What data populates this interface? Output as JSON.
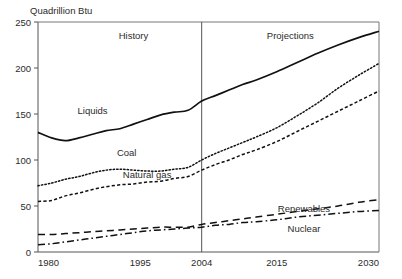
{
  "chart_data": {
    "type": "line",
    "title": "Quadrillion Btu",
    "xlabel": "",
    "ylabel": "Quadrillion Btu",
    "xlim": [
      1980,
      2030
    ],
    "ylim": [
      0,
      250
    ],
    "yticks": [
      0,
      50,
      100,
      150,
      200,
      250
    ],
    "xticks": [
      1980,
      1995,
      2004,
      2015,
      2030
    ],
    "grid": false,
    "legend": "inline-annotations",
    "annotations": [
      {
        "text": "History",
        "x": 1994,
        "y": 232
      },
      {
        "text": "Projections",
        "x": 2017,
        "y": 232
      }
    ],
    "divider_x": 2004,
    "x": [
      1980,
      1982,
      1984,
      1986,
      1988,
      1990,
      1992,
      1994,
      1996,
      1998,
      2000,
      2002,
      2004,
      2006,
      2008,
      2010,
      2012,
      2015,
      2018,
      2021,
      2024,
      2027,
      2030
    ],
    "series": [
      {
        "name": "Liquids",
        "style": "solid",
        "label_x": 1988,
        "label_y": 150,
        "values": [
          130,
          124,
          121,
          124,
          128,
          132,
          134,
          139,
          144,
          149,
          152,
          154,
          164,
          170,
          176,
          182,
          187,
          196,
          206,
          216,
          225,
          233,
          240
        ]
      },
      {
        "name": "Coal",
        "style": "dotted",
        "label_x": 1993,
        "label_y": 104,
        "values": [
          72,
          75,
          79,
          82,
          86,
          89,
          90,
          89,
          88,
          88,
          90,
          92,
          100,
          107,
          113,
          119,
          125,
          135,
          148,
          162,
          178,
          192,
          205
        ]
      },
      {
        "name": "Natural gas",
        "style": "dashed-fine",
        "label_x": 1996,
        "label_y": 80,
        "values": [
          55,
          56,
          61,
          64,
          68,
          71,
          73,
          74,
          76,
          77,
          80,
          82,
          89,
          95,
          100,
          106,
          111,
          120,
          131,
          142,
          153,
          164,
          175
        ]
      },
      {
        "name": "Renewables",
        "style": "dashed",
        "label_x": 2019,
        "label_y": 44,
        "values": [
          19,
          19,
          20,
          21,
          22,
          23,
          24,
          25,
          26,
          27,
          27,
          27,
          30,
          32,
          34,
          36,
          38,
          41,
          44,
          47,
          50,
          54,
          57
        ]
      },
      {
        "name": "Nuclear",
        "style": "dash-dot",
        "label_x": 2019,
        "label_y": 22,
        "values": [
          8,
          9,
          11,
          13,
          15,
          17,
          19,
          21,
          23,
          24,
          25,
          26,
          27,
          29,
          30,
          32,
          33,
          35,
          38,
          40,
          42,
          44,
          45
        ]
      }
    ]
  }
}
